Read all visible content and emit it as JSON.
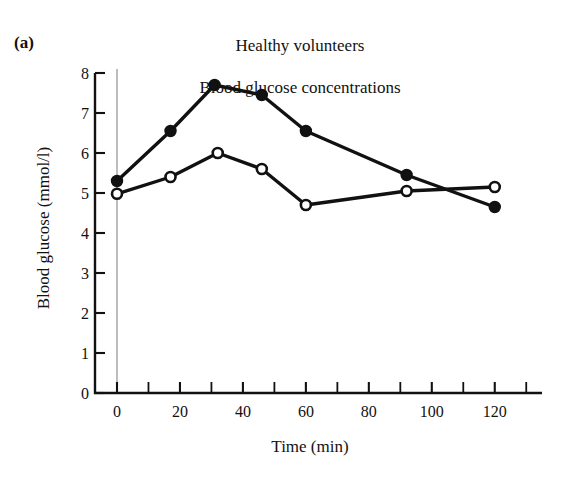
{
  "figure": {
    "panel_label": "(a)",
    "title_line_1": "Healthy volunteers",
    "title_line_2": "Blood glucose concentrations"
  },
  "axes": {
    "x_label": "Time (min)",
    "y_label": "Blood glucose (mmol/l)",
    "x_ticks": [
      "0",
      "20",
      "40",
      "60",
      "80",
      "100",
      "120"
    ],
    "y_ticks": [
      "0",
      "1",
      "2",
      "3",
      "4",
      "5",
      "6",
      "7",
      "8"
    ]
  },
  "chart_data": {
    "type": "line",
    "title": "Healthy volunteers Blood glucose concentrations",
    "xlabel": "Time (min)",
    "ylabel": "Blood glucose (mmol/l)",
    "xlim": [
      -5,
      135
    ],
    "ylim": [
      0,
      8
    ],
    "x_tick_values": [
      0,
      20,
      40,
      60,
      80,
      100,
      120
    ],
    "x_minor_tick_values": [
      10,
      30,
      50,
      70,
      90,
      110,
      130
    ],
    "y_tick_values": [
      0,
      1,
      2,
      3,
      4,
      5,
      6,
      7,
      8
    ],
    "grid": false,
    "legend": "none",
    "annotations": [
      "vertical reference line at t = 0"
    ],
    "series": [
      {
        "name": "filled-circles",
        "marker": "filled circle",
        "x": [
          0,
          17,
          31,
          46,
          60,
          92,
          120
        ],
        "values": [
          5.3,
          6.55,
          7.7,
          7.45,
          6.55,
          5.45,
          4.65
        ]
      },
      {
        "name": "open-circles",
        "marker": "open circle",
        "x": [
          0,
          17,
          32,
          46,
          60,
          92,
          120
        ],
        "values": [
          4.98,
          5.4,
          6.0,
          5.6,
          4.7,
          5.05,
          5.15
        ]
      }
    ]
  },
  "colors": {
    "ink": "#111111",
    "reference_line": "#9a9a9a",
    "background": "#ffffff"
  }
}
